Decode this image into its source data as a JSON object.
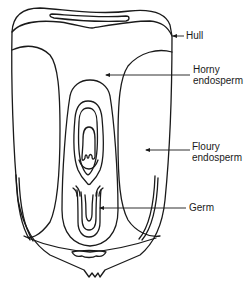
{
  "diagram": {
    "labels": [
      {
        "id": "hull",
        "lines": [
          "Hull"
        ]
      },
      {
        "id": "horny-endosperm",
        "lines": [
          "Horny",
          "endosperm"
        ]
      },
      {
        "id": "floury-endosperm",
        "lines": [
          "Floury",
          "endosperm"
        ]
      },
      {
        "id": "germ",
        "lines": [
          "Germ"
        ]
      }
    ],
    "colors": {
      "ink": "#1a1a1a",
      "background": "#ffffff"
    }
  }
}
